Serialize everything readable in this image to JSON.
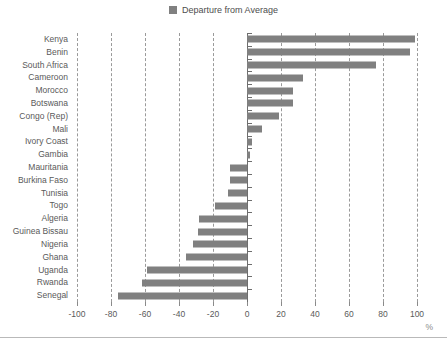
{
  "legend": {
    "entries": [
      {
        "label": "Departure from Average",
        "color": "#808080",
        "marker": "square"
      }
    ],
    "position": "top-center"
  },
  "axis_unit_label": "%",
  "chart_data": {
    "type": "bar",
    "orientation": "horizontal",
    "title": "",
    "subtitle": "",
    "xlabel": "%",
    "ylabel": "",
    "xlim": [
      -100,
      100
    ],
    "xticks": [
      -100,
      -80,
      -60,
      -40,
      -20,
      0,
      20,
      40,
      60,
      80,
      100
    ],
    "xtick_labels": [
      "-100",
      "-80",
      "-60",
      "-40",
      "-20",
      "0",
      "20",
      "40",
      "60",
      "80",
      "100"
    ],
    "grid": true,
    "grid_style": "dashed-vertical",
    "zero_line": true,
    "legend_position": "top-center",
    "bar_color": "#808080",
    "categories": [
      "Kenya",
      "Benin",
      "South Africa",
      "Cameroon",
      "Morocco",
      "Botswana",
      "Congo (Rep)",
      "Mali",
      "Ivory Coast",
      "Gambia",
      "Mauritania",
      "Burkina Faso",
      "Tunisia",
      "Togo",
      "Algeria",
      "Guinea Bissau",
      "Nigeria",
      "Ghana",
      "Uganda",
      "Rwanda",
      "Senegal"
    ],
    "series": [
      {
        "name": "Departure from Average",
        "color": "#808080",
        "values": [
          99,
          96,
          76,
          33,
          27,
          27,
          19,
          9,
          3,
          1.5,
          -10,
          -10,
          -11,
          -19,
          -28,
          -29,
          -32,
          -36,
          -59,
          -62,
          -76
        ]
      }
    ]
  }
}
